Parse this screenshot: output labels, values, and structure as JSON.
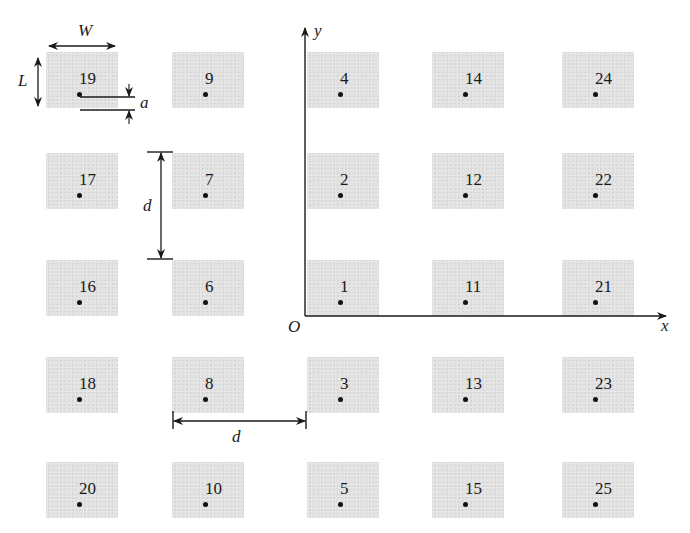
{
  "diagram": {
    "type": "antenna-array-layout",
    "grid": {
      "rows": 5,
      "cols": 5
    },
    "axes": {
      "x_label": "x",
      "y_label": "y",
      "origin_label": "O"
    },
    "dimension_labels": {
      "width": "W",
      "length": "L",
      "gap": "a",
      "spacing_vertical": "d",
      "spacing_horizontal": "d"
    },
    "colors": {
      "pad_fill": "#e2e2e2",
      "line": "#1a1a1a",
      "background": "#ffffff"
    }
  },
  "pads": [
    {
      "id": "19",
      "row": 0,
      "col": 0
    },
    {
      "id": "9",
      "row": 0,
      "col": 1
    },
    {
      "id": "4",
      "row": 0,
      "col": 2
    },
    {
      "id": "14",
      "row": 0,
      "col": 3
    },
    {
      "id": "24",
      "row": 0,
      "col": 4
    },
    {
      "id": "17",
      "row": 1,
      "col": 0
    },
    {
      "id": "7",
      "row": 1,
      "col": 1
    },
    {
      "id": "2",
      "row": 1,
      "col": 2
    },
    {
      "id": "12",
      "row": 1,
      "col": 3
    },
    {
      "id": "22",
      "row": 1,
      "col": 4
    },
    {
      "id": "16",
      "row": 2,
      "col": 0
    },
    {
      "id": "6",
      "row": 2,
      "col": 1
    },
    {
      "id": "1",
      "row": 2,
      "col": 2
    },
    {
      "id": "11",
      "row": 2,
      "col": 3
    },
    {
      "id": "21",
      "row": 2,
      "col": 4
    },
    {
      "id": "18",
      "row": 3,
      "col": 0
    },
    {
      "id": "8",
      "row": 3,
      "col": 1
    },
    {
      "id": "3",
      "row": 3,
      "col": 2
    },
    {
      "id": "13",
      "row": 3,
      "col": 3
    },
    {
      "id": "23",
      "row": 3,
      "col": 4
    },
    {
      "id": "20",
      "row": 4,
      "col": 0
    },
    {
      "id": "10",
      "row": 4,
      "col": 1
    },
    {
      "id": "5",
      "row": 4,
      "col": 2
    },
    {
      "id": "15",
      "row": 4,
      "col": 3
    },
    {
      "id": "25",
      "row": 4,
      "col": 4
    }
  ]
}
